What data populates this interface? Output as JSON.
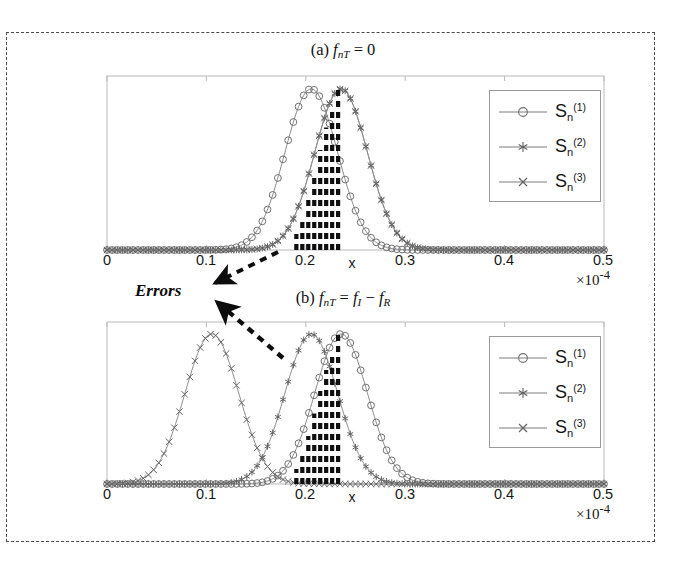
{
  "figure": {
    "errors_annotation": "Errors",
    "x_axis_name": "x",
    "exponent_label": "×10",
    "exponent_value": "-4",
    "tick_labels": [
      "0",
      "0.1",
      "0.2",
      "0.3",
      "0.4",
      "0.5"
    ],
    "legend_entries": [
      {
        "label_base": "S",
        "label_sub": "n",
        "label_sup": "(1)",
        "marker": "circle-marker"
      },
      {
        "label_base": "S",
        "label_sub": "n",
        "label_sup": "(2)",
        "marker": "asterisk-marker"
      },
      {
        "label_base": "S",
        "label_sub": "n",
        "label_sup": "(3)",
        "marker": "x-marker"
      }
    ]
  },
  "panel_a": {
    "title_prefix": "(a)",
    "title_var": "f",
    "title_sub": "nT",
    "title_rest": "= 0"
  },
  "panel_b": {
    "title_prefix": "(b)",
    "title_var": "f",
    "title_sub": "nT",
    "title_eq": "=",
    "title_var2": "f",
    "title_sub2": "I",
    "title_minus": "−",
    "title_var3": "f",
    "title_sub3": "R"
  },
  "chart_data": [
    {
      "type": "line",
      "title": "(a) f_nT = 0",
      "xlabel": "x",
      "ylabel": "",
      "xlim": [
        0,
        0.5
      ],
      "ylim": [
        0,
        1.08
      ],
      "x_unit_scale": "×10^-4",
      "xticks": [
        0,
        0.1,
        0.2,
        0.3,
        0.4,
        0.5
      ],
      "grid": false,
      "legend_position": "upper-right",
      "series": [
        {
          "name": "S_n^(1)",
          "marker": "circle",
          "shape": "gaussian",
          "mean": 0.2055,
          "sigma": 0.0265,
          "amplitude": 1.0
        },
        {
          "name": "S_n^(2)",
          "marker": "asterisk",
          "shape": "gaussian",
          "mean": 0.2355,
          "sigma": 0.0265,
          "amplitude": 1.0
        },
        {
          "name": "S_n^(3)",
          "marker": "x",
          "shape": "gaussian",
          "mean": 0.2355,
          "sigma": 0.0265,
          "amplitude": 1.0
        }
      ],
      "error_bars": {
        "description": "vertical dashed error bars between the two peaks",
        "x_positions": [
          0.1905,
          0.1965,
          0.2025,
          0.2085,
          0.2145,
          0.2205,
          0.2265,
          0.2325
        ],
        "tops": [
          0.1,
          0.19,
          0.32,
          0.47,
          0.62,
          0.76,
          0.88,
          1.0
        ]
      }
    },
    {
      "type": "line",
      "title": "(b) f_nT = f_I - f_R",
      "xlabel": "x",
      "ylabel": "",
      "xlim": [
        0,
        0.5
      ],
      "ylim": [
        0,
        1.08
      ],
      "x_unit_scale": "×10^-4",
      "xticks": [
        0,
        0.1,
        0.2,
        0.3,
        0.4,
        0.5
      ],
      "grid": false,
      "legend_position": "upper-right",
      "series": [
        {
          "name": "S_n^(1)",
          "marker": "circle",
          "shape": "gaussian",
          "mean": 0.2355,
          "sigma": 0.0265,
          "amplitude": 1.0
        },
        {
          "name": "S_n^(2)",
          "marker": "asterisk",
          "shape": "gaussian",
          "mean": 0.2055,
          "sigma": 0.0265,
          "amplitude": 1.0
        },
        {
          "name": "S_n^(3)",
          "marker": "x",
          "shape": "gaussian",
          "mean": 0.1055,
          "sigma": 0.027,
          "amplitude": 1.0
        }
      ],
      "error_bars": {
        "description": "vertical dashed error bars between the S_n^(2) and S_n^(1) peaks",
        "x_positions": [
          0.1905,
          0.1965,
          0.2025,
          0.2085,
          0.2145,
          0.2205,
          0.2265,
          0.2325
        ],
        "tops": [
          0.1,
          0.19,
          0.32,
          0.47,
          0.62,
          0.76,
          0.88,
          1.0
        ]
      }
    }
  ]
}
